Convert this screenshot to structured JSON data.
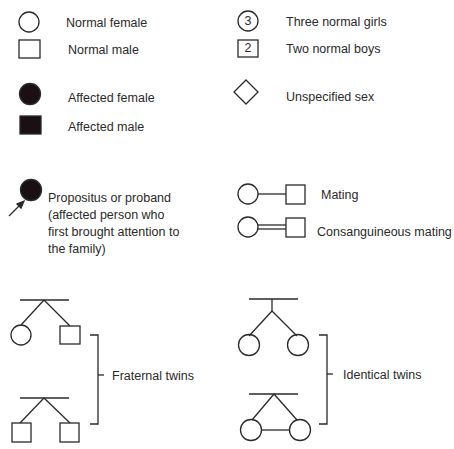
{
  "legend": {
    "normal_female": "Normal female",
    "normal_male": "Normal male",
    "affected_female": "Affected female",
    "affected_male": "Affected male",
    "three_normal_girls": "Three normal girls",
    "three_normal_girls_count": "3",
    "two_normal_boys": "Two normal boys",
    "two_normal_boys_count": "2",
    "unspecified_sex": "Unspecified sex",
    "proband": "Propositus or proband (affected person who first brought attention to the family)",
    "mating": "Mating",
    "consanguineous_mating": "Consanguineous mating",
    "fraternal_twins": "Fraternal twins",
    "identical_twins": "Identical twins"
  },
  "colors": {
    "stroke": "#2a2a2a",
    "affected_fill": "#1a1014",
    "background": "#ffffff"
  }
}
